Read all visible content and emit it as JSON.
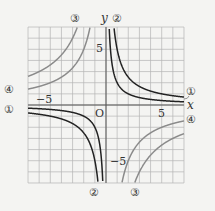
{
  "chart_data": {
    "type": "line",
    "title": "",
    "xlabel": "x",
    "ylabel": "y",
    "origin_label": "O",
    "xlim": [
      -7,
      7
    ],
    "ylim": [
      -7,
      7
    ],
    "grid": true,
    "tick_labels": {
      "x": [
        "-5",
        "5"
      ],
      "y": [
        "5",
        "-5"
      ]
    },
    "series": [
      {
        "name": "1",
        "label": "①",
        "a": 2,
        "color": "#222222",
        "formula": "y = a/x"
      },
      {
        "name": "2",
        "label": "②",
        "a": 5,
        "color": "#222222",
        "formula": "y = a/x"
      },
      {
        "name": "3",
        "label": "③",
        "a": -18,
        "color": "#8a8a8a",
        "formula": "y = a/x"
      },
      {
        "name": "4",
        "label": "④",
        "a": -10,
        "color": "#8a8a8a",
        "formula": "y = a/x"
      }
    ]
  },
  "labels": {
    "x": "x",
    "y": "y",
    "o": "O",
    "five": "5",
    "neg_five": "−5",
    "c1": "①",
    "c2": "②",
    "c3": "③",
    "c4": "④"
  }
}
